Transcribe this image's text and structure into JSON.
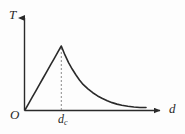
{
  "figure": {
    "background_color": "#fdfdfd",
    "stroke_color": "#2a2a2a",
    "dash_color": "#8a8a8a"
  },
  "labels": {
    "y_axis": "T",
    "x_axis": "d",
    "origin": "O",
    "critical_point_base": "d",
    "critical_point_subscript": "c"
  },
  "chart_data": {
    "type": "line",
    "title": "",
    "xlabel": "d",
    "ylabel": "T",
    "grid": false,
    "legend": null,
    "axis_arrows": true,
    "xlim": [
      0,
      1
    ],
    "ylim": [
      0,
      1
    ],
    "annotations": [
      {
        "text": "d_c",
        "x": 0.3,
        "y": 0,
        "note": "critical distance tick marking the peak position, drawn with a dashed vertical guide line up to the curve maximum"
      }
    ],
    "guide_lines": [
      {
        "type": "vertical-dashed",
        "x": 0.3,
        "y_from": 0,
        "y_to": 1.0
      }
    ],
    "series": [
      {
        "name": "T(d)",
        "style": "solid",
        "color": "#2a2a2a",
        "x": [
          0.0,
          0.03,
          0.06,
          0.09,
          0.12,
          0.15,
          0.18,
          0.21,
          0.24,
          0.27,
          0.3,
          0.33,
          0.36,
          0.39,
          0.42,
          0.45,
          0.48,
          0.52,
          0.56,
          0.6,
          0.64,
          0.68,
          0.72,
          0.76,
          0.8,
          0.85,
          0.9,
          0.95,
          1.0
        ],
        "y": [
          0.0,
          0.1,
          0.2,
          0.3,
          0.4,
          0.5,
          0.6,
          0.7,
          0.8,
          0.9,
          1.0,
          0.86,
          0.74,
          0.64,
          0.55,
          0.47,
          0.4,
          0.33,
          0.27,
          0.22,
          0.18,
          0.145,
          0.115,
          0.092,
          0.075,
          0.058,
          0.046,
          0.04,
          0.038
        ]
      }
    ]
  }
}
